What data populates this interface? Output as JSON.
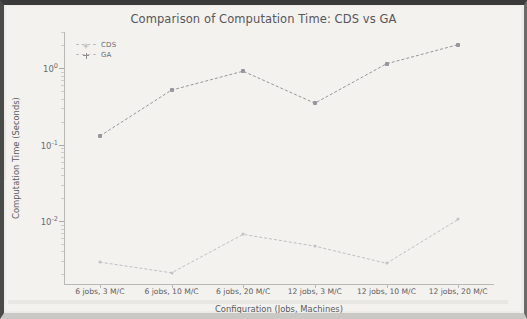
{
  "chart_data": {
    "type": "line",
    "title": "Comparison of Computation Time: CDS vs GA",
    "xlabel": "Configuration (Jobs, Machines)",
    "ylabel": "Computation Time (Seconds)",
    "yscale": "log",
    "ylim": [
      0.0015,
      3.0
    ],
    "grid": false,
    "legend_position": "upper left",
    "categories": [
      "6 jobs, 3 M/C",
      "6 jobs, 10 M/C",
      "6 jobs, 20 M/C",
      "12 jobs, 3 M/C",
      "12 jobs, 10 M/C",
      "12 jobs, 20 M/C"
    ],
    "ytick_labels": [
      "10",
      "10",
      "10"
    ],
    "ytick_exponents": [
      "0",
      "-1",
      "-2"
    ],
    "ytick_values": [
      1,
      0.1,
      0.01
    ],
    "series": [
      {
        "name": "CDS",
        "marker": "plus",
        "color": "#c0bfc4",
        "values": [
          0.0029,
          0.0021,
          0.0067,
          0.0047,
          0.0028,
          0.0105
        ]
      },
      {
        "name": "GA",
        "marker": "star",
        "color": "#97969c",
        "values": [
          0.13,
          0.52,
          0.92,
          0.35,
          1.15,
          2.05
        ]
      }
    ]
  },
  "figure": {
    "title": "Comparison of Computation Time: CDS vs GA",
    "x_axis_title": "Configuration (Jobs, Machines)",
    "y_axis_title": "Computation Time (Seconds)"
  },
  "legend": {
    "items": [
      {
        "label": "CDS",
        "icon": "plus-marker-icon"
      },
      {
        "label": "GA",
        "icon": "star-marker-icon"
      }
    ]
  }
}
